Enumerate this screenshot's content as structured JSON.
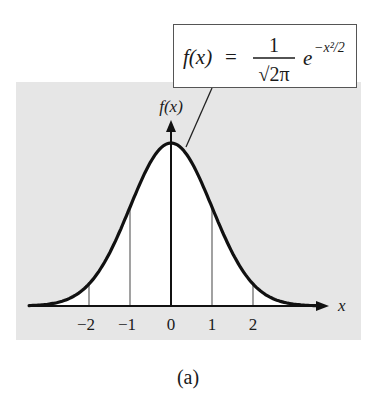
{
  "figure": {
    "caption": "(a)",
    "formula": {
      "lhs": "f(x)",
      "equals": "=",
      "numerator": "1",
      "denominator": "√2π",
      "base": "e",
      "exponent": "−x²/2"
    },
    "y_axis_label": "f(x)",
    "x_axis_label": "x",
    "colors": {
      "background_shade": "#e6e6e6",
      "under_curve": "#ffffff",
      "curve": "#111111",
      "gridline": "#555555"
    }
  },
  "chart_data": {
    "type": "line",
    "formula": "f(x) = 1/√(2π) · e^(−x²/2)",
    "xlabel": "x",
    "ylabel": "f(x)",
    "x_ticks": [
      -2,
      -1,
      0,
      1,
      2
    ],
    "x_tick_labels": [
      "−2",
      "−1",
      "0",
      "1",
      "2"
    ],
    "xlim": [
      -3.5,
      3.8
    ],
    "ylim": [
      0,
      0.45
    ],
    "vertical_reference_lines": [
      -2,
      -1,
      1,
      2
    ],
    "series": [
      {
        "name": "f(x)",
        "x": [
          -3.4,
          -3,
          -2.5,
          -2,
          -1.5,
          -1,
          -0.5,
          0,
          0.5,
          1,
          1.5,
          2,
          2.5,
          3,
          3.4
        ],
        "values": [
          0.0012,
          0.0044,
          0.0175,
          0.054,
          0.1295,
          0.242,
          0.3521,
          0.3989,
          0.3521,
          0.242,
          0.1295,
          0.054,
          0.0175,
          0.0044,
          0.0012
        ]
      }
    ],
    "grid": false,
    "legend": null
  }
}
